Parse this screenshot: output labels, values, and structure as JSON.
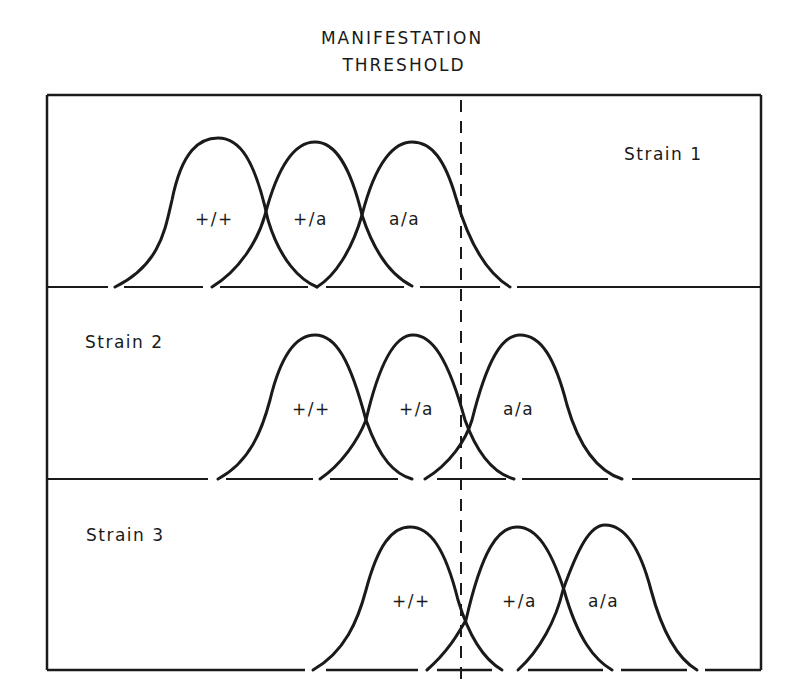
{
  "title": {
    "line1": "MANIFESTATION",
    "line2": "THRESHOLD"
  },
  "threshold": {
    "x": 461,
    "style": "dashed"
  },
  "panels": [
    {
      "name": "Strain 1",
      "label": "Strain 1",
      "label_position": "right",
      "genotypes": [
        {
          "label": "+/+",
          "peak_x": 218
        },
        {
          "label": "+/a",
          "peak_x": 315
        },
        {
          "label": "a/a",
          "peak_x": 412
        }
      ]
    },
    {
      "name": "Strain 2",
      "label": "Strain 2",
      "label_position": "left",
      "genotypes": [
        {
          "label": "+/+",
          "peak_x": 315
        },
        {
          "label": "+/a",
          "peak_x": 413
        },
        {
          "label": "a/a",
          "peak_x": 520
        }
      ]
    },
    {
      "name": "Strain 3",
      "label": "Strain 3",
      "label_position": "left",
      "genotypes": [
        {
          "label": "+/+",
          "peak_x": 410
        },
        {
          "label": "+/a",
          "peak_x": 517
        },
        {
          "label": "a/a",
          "peak_x": 605
        }
      ]
    }
  ],
  "colors": {
    "line": "#1a1a1a",
    "background": "#ffffff"
  }
}
